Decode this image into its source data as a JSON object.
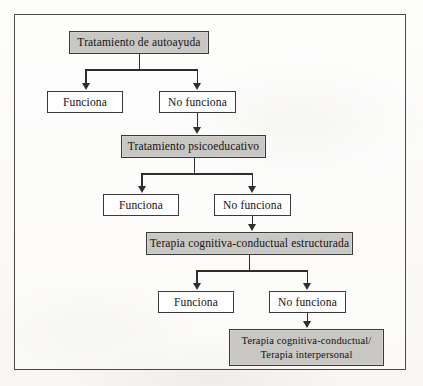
{
  "figure": {
    "kind": "flowchart",
    "language": "es",
    "border_color": "#4a4a4a",
    "treatment_fill": "#c9c7c4",
    "outcome_fill": "#fefefe",
    "line_color": "#2e2e2e"
  },
  "nodes": {
    "treatment_1": "Tratamiento de autoayuda",
    "outcome_1_works": "Funciona",
    "outcome_1_fails": "No funciona",
    "treatment_2": "Tratamiento psicoeducativo",
    "outcome_2_works": "Funciona",
    "outcome_2_fails": "No funciona",
    "treatment_3": "Terapia cognitiva-conductual estructurada",
    "outcome_3_works": "Funciona",
    "outcome_3_fails": "No funciona",
    "treatment_4_line1": "Terapia cognitiva-conductual/",
    "treatment_4_line2": "Terapia interpersonal"
  }
}
